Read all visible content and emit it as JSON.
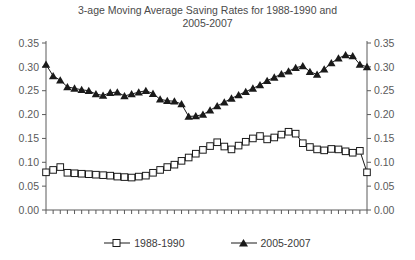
{
  "chart_data": {
    "type": "line",
    "title": "3-age Moving Average Saving Rates for 1988-1990 and\n2005-2007",
    "xlabel": "",
    "ylabel": "",
    "xlim": [
      25,
      70
    ],
    "ylim": [
      0.0,
      0.35
    ],
    "grid": false,
    "legend_position": "bottom",
    "y_ticks": [
      "0.00",
      "0.05",
      "0.10",
      "0.15",
      "0.20",
      "0.25",
      "0.30",
      "0.35"
    ],
    "y_tick_values": [
      0.0,
      0.05,
      0.1,
      0.15,
      0.2,
      0.25,
      0.3,
      0.35
    ],
    "y_axis_right_ticks": [
      "0.00",
      "0.05",
      "0.10",
      "0.15",
      "0.20",
      "0.25",
      "0.30",
      "0.35"
    ],
    "x_tick_labels": [
      "25",
      "29",
      "33",
      "37",
      "41",
      "45",
      "49",
      "53",
      "57",
      "61",
      "65",
      "69"
    ],
    "x_tick_values": [
      25,
      29,
      33,
      37,
      41,
      45,
      49,
      53,
      57,
      61,
      65,
      69
    ],
    "x": [
      25,
      26,
      27,
      28,
      29,
      30,
      31,
      32,
      33,
      34,
      35,
      36,
      37,
      38,
      39,
      40,
      41,
      42,
      43,
      44,
      45,
      46,
      47,
      48,
      49,
      50,
      51,
      52,
      53,
      54,
      55,
      56,
      57,
      58,
      59,
      60,
      61,
      62,
      63,
      64,
      65,
      66,
      67,
      68,
      69,
      70
    ],
    "series": [
      {
        "name": "1988-1990",
        "marker": "open-square",
        "color": "#1a1a1a",
        "values": [
          0.079,
          0.084,
          0.09,
          0.078,
          0.077,
          0.076,
          0.075,
          0.074,
          0.073,
          0.072,
          0.07,
          0.069,
          0.068,
          0.07,
          0.072,
          0.078,
          0.084,
          0.09,
          0.095,
          0.103,
          0.11,
          0.118,
          0.126,
          0.134,
          0.142,
          0.133,
          0.127,
          0.135,
          0.143,
          0.15,
          0.155,
          0.148,
          0.152,
          0.158,
          0.164,
          0.16,
          0.14,
          0.132,
          0.127,
          0.125,
          0.128,
          0.127,
          0.123,
          0.12,
          0.124,
          0.079
        ]
      },
      {
        "name": "2005-2007",
        "marker": "filled-triangle",
        "color": "#1a1a1a",
        "values": [
          0.305,
          0.281,
          0.272,
          0.258,
          0.255,
          0.252,
          0.25,
          0.243,
          0.24,
          0.246,
          0.247,
          0.239,
          0.243,
          0.247,
          0.25,
          0.244,
          0.232,
          0.229,
          0.228,
          0.222,
          0.196,
          0.197,
          0.2,
          0.209,
          0.218,
          0.226,
          0.234,
          0.241,
          0.248,
          0.255,
          0.262,
          0.271,
          0.278,
          0.285,
          0.291,
          0.298,
          0.302,
          0.29,
          0.284,
          0.295,
          0.308,
          0.318,
          0.325,
          0.323,
          0.305,
          0.3
        ]
      }
    ]
  },
  "legend": {
    "items": [
      {
        "label": "1988-1990",
        "marker": "open-square"
      },
      {
        "label": "2005-2007",
        "marker": "filled-triangle"
      }
    ]
  }
}
